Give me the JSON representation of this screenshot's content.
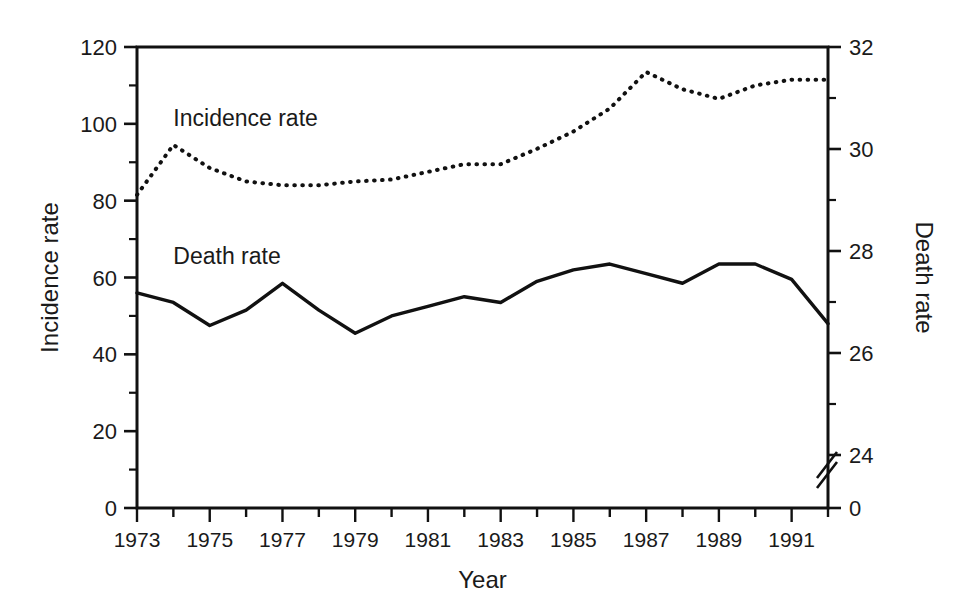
{
  "chart_data": {
    "type": "line",
    "title": "",
    "xlabel": "Year",
    "ylabel": "Incidence rate",
    "y2label": "Death rate",
    "grid": false,
    "legend_position": "inline-annotations",
    "xlim": [
      1973,
      1992
    ],
    "ylim": [
      0,
      120
    ],
    "y2lim": [
      0,
      32
    ],
    "y2_axis_break": true,
    "y2_break_note": "axis break between 0 and 24",
    "x": [
      1973,
      1974,
      1975,
      1976,
      1977,
      1978,
      1979,
      1980,
      1981,
      1982,
      1983,
      1984,
      1985,
      1986,
      1987,
      1988,
      1989,
      1990,
      1991,
      1992
    ],
    "xticks_major": [
      1973,
      1975,
      1977,
      1979,
      1981,
      1983,
      1985,
      1987,
      1989,
      1991
    ],
    "xtick_labels": [
      "1973",
      "1975",
      "1977",
      "1979",
      "1981",
      "1983",
      "1985",
      "1987",
      "1989",
      "1991"
    ],
    "yticks_major": [
      0,
      20,
      40,
      60,
      80,
      100,
      120
    ],
    "ytick_labels": [
      "0",
      "20",
      "40",
      "60",
      "80",
      "100",
      "120"
    ],
    "yticks_minor": [
      10,
      30,
      50,
      70,
      90,
      110
    ],
    "y2ticks_major": [
      0,
      24,
      26,
      28,
      30,
      32
    ],
    "y2tick_labels": [
      "0",
      "24",
      "26",
      "28",
      "30",
      "32"
    ],
    "y2ticks_minor": [
      25,
      27,
      29,
      31
    ],
    "series": [
      {
        "name": "Incidence rate",
        "axis": "left",
        "style": "dotted",
        "label_x": 1974.0,
        "label_y": 101.5,
        "values": [
          81.5,
          94.5,
          88.5,
          85.0,
          84.0,
          84.0,
          85.0,
          85.5,
          87.5,
          89.5,
          89.5,
          93.5,
          98.0,
          104.0,
          113.5,
          109.0,
          106.5,
          110.0,
          111.5,
          111.5
        ]
      },
      {
        "name": "Death rate",
        "axis": "right",
        "style": "solid",
        "label_x": 1974.0,
        "label_y": 65.5,
        "values": [
          56.0,
          53.5,
          47.5,
          51.5,
          58.5,
          51.5,
          45.5,
          50.0,
          52.5,
          55.0,
          53.5,
          59.0,
          62.0,
          63.5,
          61.0,
          58.5,
          63.5,
          63.5,
          59.5,
          48.0
        ]
      }
    ]
  },
  "annotations": {
    "incidence_label": "Incidence rate",
    "death_label": "Death rate"
  }
}
